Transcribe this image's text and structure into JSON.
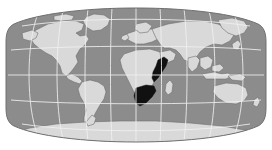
{
  "figure": {
    "kind": "world-map-thumbnail",
    "width": 272,
    "height": 150,
    "background_color": "#ffffff",
    "clipped_caption_fragment": ""
  },
  "map": {
    "projection": "Robinson",
    "ocean_color": "#8c8c8c",
    "land_color": "#d9d9d9",
    "land_border_color": "#6e6e6e",
    "highlight_color": "#111111",
    "graticule_color": "#f0f0f0",
    "outline_color": "#707070",
    "graticule": {
      "visible": true,
      "meridian_spacing_degrees": 30,
      "parallel_spacing_degrees": 30
    },
    "extent": {
      "left_px": 10,
      "right_px": 262,
      "top_px": 8,
      "bottom_px": 142,
      "center_x_px": 136,
      "center_y_px": 75
    },
    "highlighted_regions": [
      {
        "name": "horn-of-africa",
        "label": "Horn of Africa",
        "color": "#111111"
      },
      {
        "name": "southern-africa",
        "label": "Southern Africa",
        "color": "#111111"
      }
    ],
    "landmasses": [
      "north-america",
      "south-america",
      "greenland",
      "europe",
      "africa",
      "asia",
      "australia",
      "antarctica",
      "indonesia",
      "japan",
      "madagascar",
      "british-isles",
      "new-zealand"
    ]
  }
}
